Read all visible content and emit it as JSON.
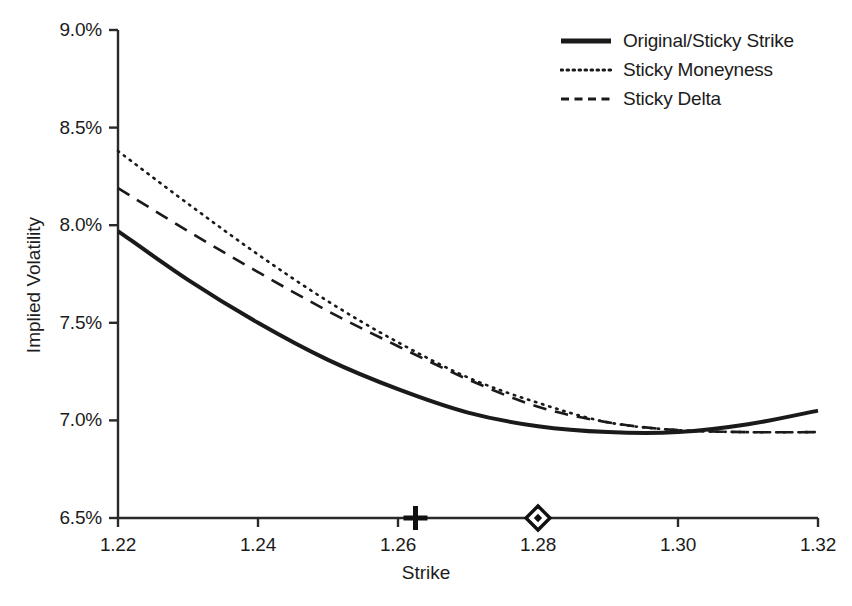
{
  "chart_data": {
    "type": "line",
    "title": "",
    "subtitle": "",
    "xlabel": "Strike",
    "ylabel": "Implied Volatility",
    "xlim": [
      1.22,
      1.32
    ],
    "ylim": [
      6.5,
      9.0
    ],
    "grid": false,
    "legend_position": "top-right",
    "xticks": [
      1.22,
      1.24,
      1.26,
      1.28,
      1.3,
      1.32
    ],
    "xtick_labels": [
      "1.22",
      "1.24",
      "1.26",
      "1.28",
      "1.30",
      "1.32"
    ],
    "yticks": [
      6.5,
      7.0,
      7.5,
      8.0,
      8.5,
      9.0
    ],
    "ytick_labels": [
      "6.5%",
      "7.0%",
      "7.5%",
      "8.0%",
      "8.5%",
      "9.0%"
    ],
    "x": [
      1.22,
      1.23,
      1.24,
      1.25,
      1.26,
      1.27,
      1.28,
      1.29,
      1.3,
      1.31,
      1.32
    ],
    "series": [
      {
        "name": "Original/Sticky Strike",
        "style": "solid",
        "color": "#1a1a1a",
        "width": 4,
        "values": [
          7.97,
          7.72,
          7.5,
          7.31,
          7.16,
          7.04,
          6.97,
          6.94,
          6.94,
          6.98,
          7.05
        ]
      },
      {
        "name": "Sticky Moneyness",
        "style": "dotted",
        "color": "#1a1a1a",
        "width": 2.6,
        "values": [
          8.38,
          8.11,
          7.85,
          7.61,
          7.4,
          7.22,
          7.09,
          6.99,
          6.95,
          6.94,
          6.94
        ]
      },
      {
        "name": "Sticky Delta",
        "style": "dashed",
        "color": "#1a1a1a",
        "width": 2.6,
        "values": [
          8.19,
          7.97,
          7.76,
          7.56,
          7.38,
          7.21,
          7.07,
          6.99,
          6.95,
          6.94,
          6.94
        ]
      }
    ],
    "markers": [
      {
        "name": "plus-marker",
        "symbol": "plus",
        "x": 1.2625,
        "y": 6.5
      },
      {
        "name": "diamond-marker",
        "symbol": "diamond",
        "x": 1.28,
        "y": 6.5
      }
    ],
    "axis_color": "#2a2a2a"
  },
  "legend": {
    "entries": [
      {
        "label": "Original/Sticky Strike",
        "style": "solid"
      },
      {
        "label": "Sticky Moneyness",
        "style": "dotted"
      },
      {
        "label": "Sticky Delta",
        "style": "dashed"
      }
    ]
  }
}
